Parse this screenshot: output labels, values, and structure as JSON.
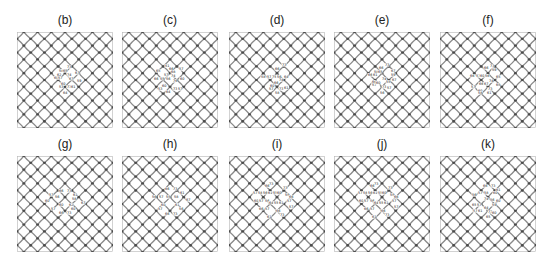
{
  "figure": {
    "panels": [
      {
        "id": "b",
        "title": "(b)",
        "labels": [
          {
            "t": "73",
            "x": 50,
            "y": 36
          },
          {
            "t": "58",
            "x": 42,
            "y": 40
          },
          {
            "t": "65",
            "x": 46,
            "y": 40
          },
          {
            "t": "67",
            "x": 58,
            "y": 42
          },
          {
            "t": "62",
            "x": 40,
            "y": 44
          },
          {
            "t": "74",
            "x": 50,
            "y": 44
          },
          {
            "t": "60",
            "x": 37,
            "y": 47
          },
          {
            "t": "57",
            "x": 41,
            "y": 47
          },
          {
            "t": "67",
            "x": 52,
            "y": 48
          },
          {
            "t": "59",
            "x": 60,
            "y": 50
          },
          {
            "t": "60",
            "x": 44,
            "y": 53
          },
          {
            "t": "53",
            "x": 42,
            "y": 56
          },
          {
            "t": "73",
            "x": 50,
            "y": 56
          },
          {
            "t": "61",
            "x": 54,
            "y": 56
          },
          {
            "t": "64",
            "x": 46,
            "y": 62
          }
        ]
      },
      {
        "id": "c",
        "title": "(c)",
        "labels": [
          {
            "t": "51",
            "x": 43,
            "y": 35
          },
          {
            "t": "66",
            "x": 47,
            "y": 38
          },
          {
            "t": "57",
            "x": 57,
            "y": 38
          },
          {
            "t": "65",
            "x": 34,
            "y": 40
          },
          {
            "t": "68",
            "x": 49,
            "y": 41
          },
          {
            "t": "57",
            "x": 42,
            "y": 44
          },
          {
            "t": "74",
            "x": 49,
            "y": 45
          },
          {
            "t": "66",
            "x": 32,
            "y": 48
          },
          {
            "t": "55",
            "x": 38,
            "y": 48
          },
          {
            "t": "56",
            "x": 44,
            "y": 48
          },
          {
            "t": "76",
            "x": 51,
            "y": 50
          },
          {
            "t": "60",
            "x": 58,
            "y": 48
          },
          {
            "t": "60",
            "x": 40,
            "y": 55
          },
          {
            "t": "53",
            "x": 36,
            "y": 58
          },
          {
            "t": "73",
            "x": 51,
            "y": 58
          },
          {
            "t": "57",
            "x": 56,
            "y": 58
          },
          {
            "t": "64",
            "x": 44,
            "y": 61
          }
        ]
      },
      {
        "id": "d",
        "title": "(d)",
        "labels": [
          {
            "t": "73",
            "x": 53,
            "y": 34
          },
          {
            "t": "66",
            "x": 46,
            "y": 38
          },
          {
            "t": "58",
            "x": 32,
            "y": 46
          },
          {
            "t": "57",
            "x": 38,
            "y": 46
          },
          {
            "t": "75",
            "x": 43,
            "y": 46
          },
          {
            "t": "56",
            "x": 48,
            "y": 46
          },
          {
            "t": "64",
            "x": 55,
            "y": 46
          },
          {
            "t": "74",
            "x": 50,
            "y": 49
          },
          {
            "t": "66",
            "x": 45,
            "y": 52
          },
          {
            "t": "60",
            "x": 41,
            "y": 55
          },
          {
            "t": "57",
            "x": 40,
            "y": 58
          },
          {
            "t": "73",
            "x": 50,
            "y": 58
          },
          {
            "t": "61",
            "x": 55,
            "y": 57
          },
          {
            "t": "58",
            "x": 46,
            "y": 62
          }
        ]
      },
      {
        "id": "e",
        "title": "(e)",
        "labels": [
          {
            "t": "73",
            "x": 51,
            "y": 34
          },
          {
            "t": "66",
            "x": 45,
            "y": 37
          },
          {
            "t": "67",
            "x": 57,
            "y": 40
          },
          {
            "t": "58",
            "x": 40,
            "y": 41
          },
          {
            "t": "65",
            "x": 44,
            "y": 41
          },
          {
            "t": "59",
            "x": 57,
            "y": 44
          },
          {
            "t": "66",
            "x": 34,
            "y": 44
          },
          {
            "t": "61",
            "x": 39,
            "y": 44
          },
          {
            "t": "74",
            "x": 48,
            "y": 48
          },
          {
            "t": "66",
            "x": 38,
            "y": 51
          },
          {
            "t": "57",
            "x": 38,
            "y": 54
          },
          {
            "t": "60",
            "x": 42,
            "y": 52
          },
          {
            "t": "55",
            "x": 52,
            "y": 51
          },
          {
            "t": "67",
            "x": 58,
            "y": 49
          },
          {
            "t": "73",
            "x": 48,
            "y": 56
          },
          {
            "t": "57",
            "x": 53,
            "y": 57
          },
          {
            "t": "56",
            "x": 46,
            "y": 62
          }
        ]
      },
      {
        "id": "f",
        "title": "(f)",
        "labels": [
          {
            "t": "73",
            "x": 50,
            "y": 35
          },
          {
            "t": "66",
            "x": 44,
            "y": 37
          },
          {
            "t": "59",
            "x": 52,
            "y": 39
          },
          {
            "t": "66",
            "x": 30,
            "y": 45
          },
          {
            "t": "57",
            "x": 36,
            "y": 45
          },
          {
            "t": "60",
            "x": 40,
            "y": 45
          },
          {
            "t": "56",
            "x": 45,
            "y": 45
          },
          {
            "t": "65",
            "x": 56,
            "y": 46
          },
          {
            "t": "74",
            "x": 49,
            "y": 50
          },
          {
            "t": "66",
            "x": 39,
            "y": 53
          },
          {
            "t": "67",
            "x": 44,
            "y": 53
          },
          {
            "t": "65",
            "x": 56,
            "y": 54
          },
          {
            "t": "57",
            "x": 31,
            "y": 56
          },
          {
            "t": "60",
            "x": 38,
            "y": 60
          },
          {
            "t": "73",
            "x": 48,
            "y": 58
          },
          {
            "t": "61",
            "x": 47,
            "y": 62
          },
          {
            "t": "58",
            "x": 38,
            "y": 62
          }
        ]
      },
      {
        "id": "g",
        "title": "(g)",
        "labels": [
          {
            "t": "66",
            "x": 42,
            "y": 36
          },
          {
            "t": "73",
            "x": 50,
            "y": 36
          },
          {
            "t": "61",
            "x": 56,
            "y": 40
          },
          {
            "t": "57",
            "x": 32,
            "y": 40
          },
          {
            "t": "56",
            "x": 38,
            "y": 42
          },
          {
            "t": "58",
            "x": 55,
            "y": 44
          },
          {
            "t": "60",
            "x": 28,
            "y": 46
          },
          {
            "t": "60",
            "x": 42,
            "y": 50
          },
          {
            "t": "62",
            "x": 52,
            "y": 50
          },
          {
            "t": "67",
            "x": 64,
            "y": 48
          },
          {
            "t": "57",
            "x": 34,
            "y": 54
          },
          {
            "t": "60",
            "x": 54,
            "y": 54
          },
          {
            "t": "66",
            "x": 42,
            "y": 58
          },
          {
            "t": "73",
            "x": 50,
            "y": 58
          }
        ]
      },
      {
        "id": "h",
        "title": "(h)",
        "labels": [
          {
            "t": "66",
            "x": 43,
            "y": 34
          },
          {
            "t": "73",
            "x": 51,
            "y": 34
          },
          {
            "t": "61",
            "x": 58,
            "y": 38
          },
          {
            "t": "56",
            "x": 30,
            "y": 42
          },
          {
            "t": "57",
            "x": 37,
            "y": 42
          },
          {
            "t": "55",
            "x": 44,
            "y": 42
          },
          {
            "t": "58",
            "x": 52,
            "y": 42
          },
          {
            "t": "67",
            "x": 64,
            "y": 45
          },
          {
            "t": "60",
            "x": 39,
            "y": 50
          },
          {
            "t": "61",
            "x": 53,
            "y": 50
          },
          {
            "t": "57",
            "x": 36,
            "y": 54
          },
          {
            "t": "56",
            "x": 57,
            "y": 54
          },
          {
            "t": "66",
            "x": 43,
            "y": 59
          },
          {
            "t": "73",
            "x": 51,
            "y": 59
          }
        ]
      },
      {
        "id": "i",
        "title": "(i)",
        "labels": [
          {
            "t": "73",
            "x": 40,
            "y": 29
          },
          {
            "t": "66",
            "x": 36,
            "y": 31
          },
          {
            "t": "73",
            "x": 54,
            "y": 33
          },
          {
            "t": "57",
            "x": 24,
            "y": 38
          },
          {
            "t": "58",
            "x": 29,
            "y": 38
          },
          {
            "t": "56",
            "x": 34,
            "y": 38
          },
          {
            "t": "61",
            "x": 39,
            "y": 38
          },
          {
            "t": "55",
            "x": 44,
            "y": 38
          },
          {
            "t": "60",
            "x": 48,
            "y": 38
          },
          {
            "t": "59",
            "x": 56,
            "y": 40
          },
          {
            "t": "66",
            "x": 60,
            "y": 42
          },
          {
            "t": "57",
            "x": 58,
            "y": 46
          },
          {
            "t": "60",
            "x": 25,
            "y": 46
          },
          {
            "t": "57",
            "x": 30,
            "y": 46
          },
          {
            "t": "56",
            "x": 36,
            "y": 46
          },
          {
            "t": "64",
            "x": 40,
            "y": 48
          },
          {
            "t": "55",
            "x": 45,
            "y": 48
          },
          {
            "t": "61",
            "x": 50,
            "y": 48
          },
          {
            "t": "57",
            "x": 60,
            "y": 52
          },
          {
            "t": "66",
            "x": 30,
            "y": 54
          },
          {
            "t": "57",
            "x": 36,
            "y": 54
          },
          {
            "t": "66",
            "x": 47,
            "y": 56
          },
          {
            "t": "73",
            "x": 51,
            "y": 60
          },
          {
            "t": "61",
            "x": 38,
            "y": 62
          }
        ]
      },
      {
        "id": "j",
        "title": "(j)",
        "labels": [
          {
            "t": "73",
            "x": 40,
            "y": 29
          },
          {
            "t": "66",
            "x": 36,
            "y": 31
          },
          {
            "t": "73",
            "x": 54,
            "y": 33
          },
          {
            "t": "57",
            "x": 24,
            "y": 38
          },
          {
            "t": "58",
            "x": 29,
            "y": 38
          },
          {
            "t": "56",
            "x": 34,
            "y": 38
          },
          {
            "t": "61",
            "x": 39,
            "y": 38
          },
          {
            "t": "55",
            "x": 44,
            "y": 38
          },
          {
            "t": "60",
            "x": 48,
            "y": 38
          },
          {
            "t": "59",
            "x": 56,
            "y": 40
          },
          {
            "t": "66",
            "x": 60,
            "y": 42
          },
          {
            "t": "57",
            "x": 58,
            "y": 46
          },
          {
            "t": "60",
            "x": 25,
            "y": 46
          },
          {
            "t": "57",
            "x": 30,
            "y": 46
          },
          {
            "t": "56",
            "x": 36,
            "y": 46
          },
          {
            "t": "64",
            "x": 40,
            "y": 48
          },
          {
            "t": "55",
            "x": 45,
            "y": 48
          },
          {
            "t": "61",
            "x": 50,
            "y": 48
          },
          {
            "t": "57",
            "x": 60,
            "y": 52
          },
          {
            "t": "66",
            "x": 30,
            "y": 54
          },
          {
            "t": "57",
            "x": 36,
            "y": 54
          },
          {
            "t": "66",
            "x": 47,
            "y": 56
          },
          {
            "t": "73",
            "x": 51,
            "y": 60
          },
          {
            "t": "61",
            "x": 38,
            "y": 62
          }
        ]
      },
      {
        "id": "k",
        "title": "(k)",
        "labels": [
          {
            "t": "66",
            "x": 43,
            "y": 31
          },
          {
            "t": "73",
            "x": 51,
            "y": 31
          },
          {
            "t": "61",
            "x": 56,
            "y": 35
          },
          {
            "t": "57",
            "x": 38,
            "y": 38
          },
          {
            "t": "58",
            "x": 44,
            "y": 38
          },
          {
            "t": "60",
            "x": 53,
            "y": 38
          },
          {
            "t": "56",
            "x": 32,
            "y": 40
          },
          {
            "t": "74",
            "x": 44,
            "y": 44
          },
          {
            "t": "56",
            "x": 50,
            "y": 45
          },
          {
            "t": "60",
            "x": 56,
            "y": 46
          },
          {
            "t": "65",
            "x": 32,
            "y": 50
          },
          {
            "t": "57",
            "x": 37,
            "y": 50
          },
          {
            "t": "64",
            "x": 44,
            "y": 53
          },
          {
            "t": "59",
            "x": 52,
            "y": 50
          },
          {
            "t": "57",
            "x": 33,
            "y": 56
          },
          {
            "t": "61",
            "x": 38,
            "y": 56
          },
          {
            "t": "73",
            "x": 48,
            "y": 57
          },
          {
            "t": "60",
            "x": 52,
            "y": 58
          },
          {
            "t": "65",
            "x": 46,
            "y": 62
          }
        ]
      }
    ]
  },
  "style": {
    "bond_color": "#8a8a8a",
    "node_color": "#4a4a4a",
    "frame_color": "#b5b5b5"
  }
}
